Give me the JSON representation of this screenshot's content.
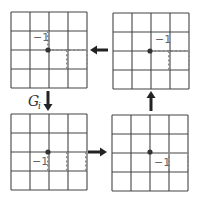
{
  "diagram": {
    "colors": {
      "grid": "#444444",
      "dotted": "#8a8a8a",
      "node": "#333333",
      "arrow": "#222222",
      "label": "#666666"
    },
    "cell_size": 19,
    "grid_cells": 4,
    "panels": [
      {
        "id": "top-left",
        "origin": [
          11,
          12
        ],
        "node": [
          48,
          50
        ],
        "label": "−1",
        "label_pos": [
          33,
          41
        ],
        "dotted_segments": [
          [
            [
              48,
              31
            ],
            [
              48,
              50
            ]
          ],
          [
            [
              48,
              50
            ],
            [
              87,
              50
            ]
          ],
          [
            [
              67,
              50
            ],
            [
              67,
              69
            ]
          ],
          [
            [
              87,
              50
            ],
            [
              87,
              69
            ]
          ]
        ]
      },
      {
        "id": "top-right",
        "origin": [
          113,
          13
        ],
        "node": [
          150,
          51
        ],
        "label": "−1",
        "label_pos": [
          155,
          43
        ],
        "dotted_segments": [
          [
            [
              150,
              51
            ],
            [
              189,
              51
            ]
          ],
          [
            [
              169,
              51
            ],
            [
              169,
              70
            ]
          ],
          [
            [
              189,
              51
            ],
            [
              189,
              70
            ]
          ]
        ]
      },
      {
        "id": "bottom-left",
        "origin": [
          11,
          114
        ],
        "node": [
          48,
          152
        ],
        "label": "−1",
        "label_pos": [
          32,
          165
        ],
        "dotted_segments": [
          [
            [
              48,
              152
            ],
            [
              48,
              172
            ]
          ],
          [
            [
              67,
              152
            ],
            [
              67,
              172
            ]
          ],
          [
            [
              86,
              152
            ],
            [
              86,
              172
            ]
          ]
        ]
      },
      {
        "id": "bottom-right",
        "origin": [
          112,
          115
        ],
        "node": [
          150,
          152
        ],
        "label": "−1",
        "label_pos": [
          154,
          166
        ],
        "dotted_segments": [
          [
            [
              169,
              152
            ],
            [
              169,
              172
            ]
          ],
          [
            [
              188,
              152
            ],
            [
              188,
              172
            ]
          ]
        ]
      }
    ],
    "arrows": [
      {
        "id": "arrow-top",
        "direction": "left",
        "from": [
          108,
          50
        ],
        "to": [
          90,
          50
        ]
      },
      {
        "id": "arrow-left",
        "direction": "down",
        "from": [
          48,
          91
        ],
        "to": [
          48,
          111
        ],
        "label": "G",
        "label_sub": "i",
        "label_pos": [
          28,
          106
        ]
      },
      {
        "id": "arrow-bottom",
        "direction": "right",
        "from": [
          88,
          152
        ],
        "to": [
          107,
          152
        ]
      },
      {
        "id": "arrow-right",
        "direction": "up",
        "from": [
          151,
          111
        ],
        "to": [
          151,
          91
        ]
      }
    ]
  }
}
